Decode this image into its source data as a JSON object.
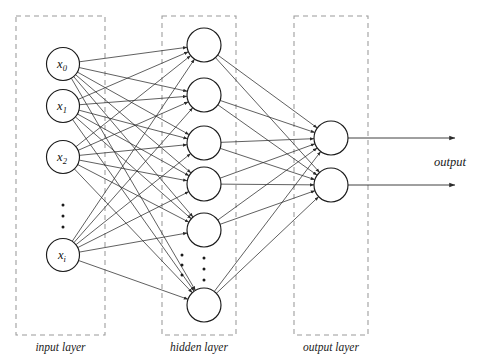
{
  "diagram": {
    "background_color": "#ffffff",
    "node_stroke_color": "#1a1a1a",
    "edge_color": "#2b2b2b",
    "box_color": "#9a9a9a",
    "layers": {
      "input": {
        "caption": "input layer",
        "box": {
          "x": 16,
          "y": 16,
          "width": 89,
          "height": 319
        },
        "node_radius": 16.5,
        "nodes": [
          {
            "id": "x0",
            "label_base": "x",
            "label_sub": "0",
            "cx": 63,
            "cy": 64
          },
          {
            "id": "x1",
            "label_base": "x",
            "label_sub": "1",
            "cx": 63,
            "cy": 106
          },
          {
            "id": "x2",
            "label_base": "x",
            "label_sub": "2",
            "cx": 63,
            "cy": 157
          },
          {
            "id": "xi",
            "label_base": "x",
            "label_sub": "i",
            "cx": 63,
            "cy": 255
          }
        ],
        "ellipsis": {
          "cx": 63,
          "dots_y": [
            205,
            216,
            227
          ]
        }
      },
      "hidden": {
        "caption": "hidden layer",
        "box": {
          "x": 162,
          "y": 16,
          "width": 74,
          "height": 319
        },
        "node_radius": 17,
        "nodes": [
          {
            "id": "h1",
            "cx": 204,
            "cy": 45
          },
          {
            "id": "h2",
            "cx": 204,
            "cy": 95
          },
          {
            "id": "h3",
            "cx": 204,
            "cy": 143
          },
          {
            "id": "h4",
            "cx": 204,
            "cy": 184
          },
          {
            "id": "h5",
            "cx": 204,
            "cy": 230
          },
          {
            "id": "h6",
            "cx": 204,
            "cy": 305
          }
        ],
        "ellipsis": {
          "cx": 204,
          "dots_y": [
            258,
            269,
            280
          ]
        },
        "ellipsis_left": {
          "cx": 182,
          "dots_y": [
            255,
            265,
            275
          ]
        }
      },
      "output": {
        "caption": "output layer",
        "box": {
          "x": 294,
          "y": 16,
          "width": 74,
          "height": 319
        },
        "node_radius": 17,
        "nodes": [
          {
            "id": "o1",
            "cx": 331,
            "cy": 138
          },
          {
            "id": "o2",
            "cx": 331,
            "cy": 185
          }
        ],
        "arrows": [
          {
            "x1": 348,
            "y1": 138,
            "x2": 455,
            "y2": 138
          },
          {
            "x1": 348,
            "y1": 185,
            "x2": 455,
            "y2": 185
          }
        ],
        "output_label": "output",
        "output_label_pos": {
          "x": 450,
          "y": 166
        }
      }
    },
    "connections": {
      "input_to_hidden_note": "fully connected, every input node to every hidden node",
      "hidden_to_output_note": "fully connected, every hidden node to every output node"
    }
  }
}
